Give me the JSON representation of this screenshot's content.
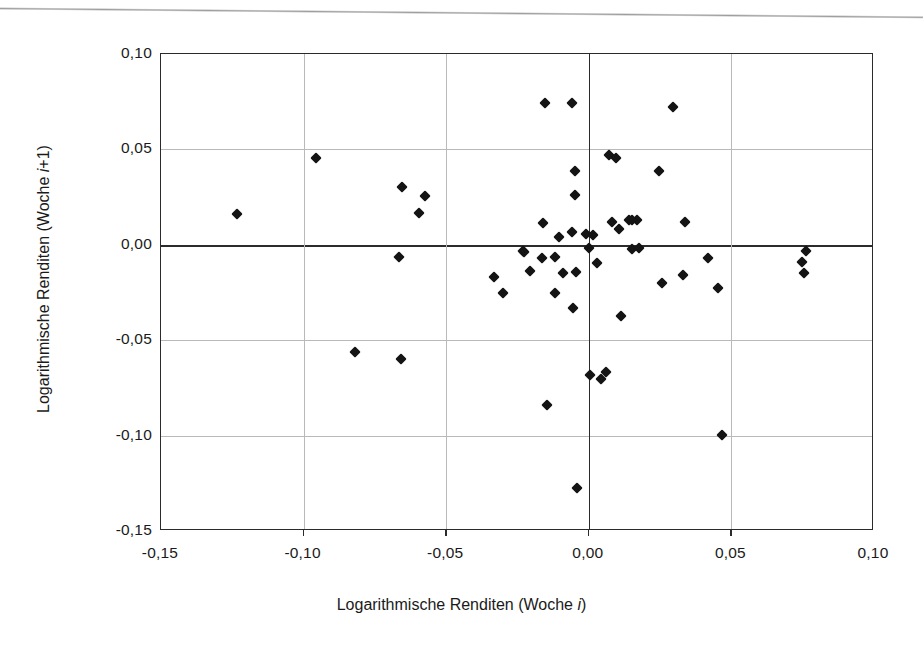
{
  "chart_data": {
    "type": "scatter",
    "title": "",
    "xlabel": "Logarithmische Renditen (Woche i)",
    "xlabel_prefix": "Logarithmische Renditen (Woche ",
    "xlabel_italic": "i",
    "xlabel_suffix": ")",
    "ylabel": "Logarithmische Renditen (Woche i+1)",
    "ylabel_prefix": "Logarithmische Renditen (Woche ",
    "ylabel_italic": "i",
    "ylabel_suffix": "+1)",
    "xlim": [
      -0.15,
      0.1
    ],
    "ylim": [
      -0.15,
      0.1
    ],
    "xticks": [
      -0.15,
      -0.1,
      -0.05,
      0.0,
      0.05,
      0.1
    ],
    "yticks": [
      0.1,
      0.05,
      0.0,
      -0.05,
      -0.1,
      -0.15
    ],
    "xticklabels": [
      "-0,15",
      "-0,10",
      "-0,05",
      "0,00",
      "0,05",
      "0,10"
    ],
    "yticklabels": [
      "0,10",
      "0,05",
      "0,00",
      "-0,05",
      "-0,10",
      "-0,15"
    ],
    "grid": true,
    "grid_color": "#b9b9b9",
    "axis_color": "#2b2b2b",
    "marker_color": "#141414",
    "marker_shape": "diamond",
    "legend": null,
    "decimal_separator": ",",
    "n_points": 56,
    "points": [
      [
        -0.1235,
        0.016
      ],
      [
        -0.0955,
        0.0457
      ],
      [
        -0.082,
        -0.0562
      ],
      [
        -0.0665,
        -0.0065
      ],
      [
        -0.0655,
        0.0303
      ],
      [
        -0.066,
        -0.06
      ],
      [
        -0.0595,
        0.0168
      ],
      [
        -0.0575,
        0.0258
      ],
      [
        -0.0333,
        -0.017
      ],
      [
        -0.0302,
        -0.0255
      ],
      [
        -0.023,
        -0.003
      ],
      [
        -0.0228,
        -0.0038
      ],
      [
        -0.0205,
        -0.0135
      ],
      [
        -0.016,
        0.0112
      ],
      [
        -0.0152,
        0.0742
      ],
      [
        -0.0147,
        -0.084
      ],
      [
        -0.012,
        -0.0253
      ],
      [
        -0.0118,
        -0.0065
      ],
      [
        -0.0105,
        0.004
      ],
      [
        -0.0092,
        -0.0147
      ],
      [
        -0.006,
        0.0742
      ],
      [
        -0.0058,
        0.0068
      ],
      [
        -0.0055,
        -0.033
      ],
      [
        -0.005,
        0.0385
      ],
      [
        -0.0048,
        0.026
      ],
      [
        -0.0045,
        -0.0145
      ],
      [
        -0.0042,
        -0.1275
      ],
      [
        -0.001,
        0.0057
      ],
      [
        0.0,
        -0.0015
      ],
      [
        0.0005,
        -0.0683
      ],
      [
        0.0013,
        0.0052
      ],
      [
        0.0028,
        -0.0098
      ],
      [
        0.0042,
        -0.0705
      ],
      [
        0.006,
        -0.0665
      ],
      [
        0.007,
        0.0472
      ],
      [
        0.0082,
        0.0122
      ],
      [
        0.0095,
        0.0455
      ],
      [
        0.0105,
        0.0083
      ],
      [
        0.0113,
        -0.0375
      ],
      [
        0.014,
        0.0132
      ],
      [
        0.015,
        -0.002
      ],
      [
        0.0168,
        0.0128
      ],
      [
        0.0175,
        -0.0018
      ],
      [
        0.0245,
        0.0385
      ],
      [
        0.0255,
        -0.02
      ],
      [
        0.0295,
        0.072
      ],
      [
        0.033,
        -0.0157
      ],
      [
        0.0338,
        0.0118
      ],
      [
        0.0418,
        -0.0067
      ],
      [
        0.0452,
        -0.0225
      ],
      [
        0.0468,
        -0.0995
      ],
      [
        0.0748,
        -0.0092
      ],
      [
        0.0755,
        -0.0148
      ],
      [
        0.076,
        -0.0032
      ],
      [
        -0.0165,
        -0.0068
      ],
      [
        0.015,
        0.0128
      ]
    ]
  },
  "figure": {
    "background": "#ffffff",
    "scan_artifact": true
  }
}
